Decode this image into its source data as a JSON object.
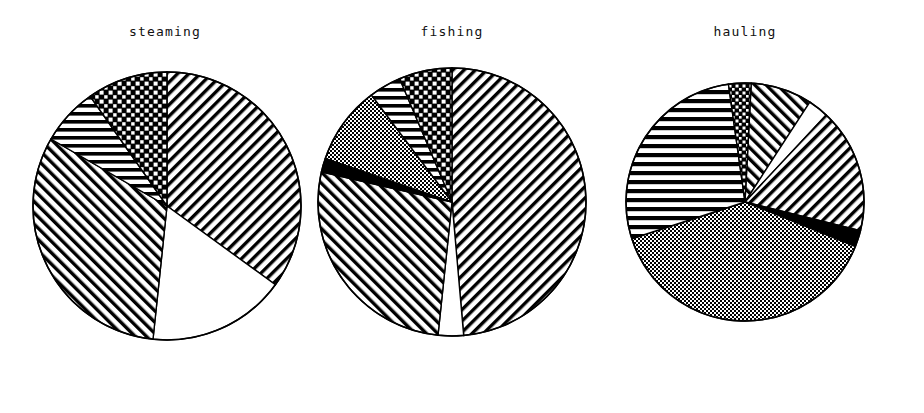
{
  "figure": {
    "background": "#ffffff",
    "outline_color": "#000000",
    "width": 924,
    "height": 413
  },
  "panels": [
    {
      "title": "steaming",
      "center_x": 167,
      "center_y": 206,
      "radius": 134,
      "title_x": 167
    },
    {
      "title": "fishing",
      "center_x": 452,
      "center_y": 202,
      "radius": 134,
      "title_x": 452
    },
    {
      "title": "hauling",
      "center_x": 745,
      "center_y": 202,
      "radius": 119,
      "title_x": 745
    }
  ],
  "chart_data": {
    "type": "pie",
    "title": "",
    "subtitle": "",
    "xlabel": "",
    "ylabel": "",
    "legend_position": "none",
    "grid": false,
    "note": "Three monochrome pie charts with black-and-white fill patterns; slice values are percentages read off the wedge angles, clockwise starting at 12 o'clock.",
    "categories": [
      "checkerboard",
      "horizontal-stripes",
      "grey-stipple",
      "solid-black",
      "backslash-hatch",
      "white",
      "forward-hatch"
    ],
    "charts": [
      {
        "title": "steaming",
        "slices": [
          {
            "label": "forward-hatch",
            "pattern": "forward-hatch",
            "start_deg": 0,
            "end_deg": 126,
            "value": 35.0
          },
          {
            "label": "white",
            "pattern": "white",
            "start_deg": 126,
            "end_deg": 186,
            "value": 16.7
          },
          {
            "label": "backslash-hatch",
            "pattern": "backslash-hatch",
            "start_deg": 186,
            "end_deg": 300,
            "value": 31.7
          },
          {
            "label": "horizontal-stripes",
            "pattern": "horizontal-stripes",
            "start_deg": 300,
            "end_deg": 325,
            "value": 6.9
          },
          {
            "label": "checkerboard",
            "pattern": "checkerboard",
            "start_deg": 325,
            "end_deg": 360,
            "value": 9.7
          }
        ]
      },
      {
        "title": "fishing",
        "slices": [
          {
            "label": "forward-hatch",
            "pattern": "forward-hatch",
            "start_deg": 0,
            "end_deg": 175,
            "value": 48.6
          },
          {
            "label": "white",
            "pattern": "white",
            "start_deg": 175,
            "end_deg": 186,
            "value": 3.1
          },
          {
            "label": "backslash-hatch",
            "pattern": "backslash-hatch",
            "start_deg": 186,
            "end_deg": 283,
            "value": 26.9
          },
          {
            "label": "solid-black",
            "pattern": "solid-black",
            "start_deg": 283,
            "end_deg": 289,
            "value": 1.7
          },
          {
            "label": "grey-stipple",
            "pattern": "grey-stipple",
            "start_deg": 289,
            "end_deg": 323,
            "value": 9.4
          },
          {
            "label": "horizontal-stripes",
            "pattern": "horizontal-stripes",
            "start_deg": 323,
            "end_deg": 337,
            "value": 3.9
          },
          {
            "label": "checkerboard",
            "pattern": "checkerboard",
            "start_deg": 337,
            "end_deg": 360,
            "value": 6.4
          }
        ]
      },
      {
        "title": "hauling",
        "slices": [
          {
            "label": "backslash-hatch",
            "pattern": "backslash-hatch",
            "start_deg": 3,
            "end_deg": 33,
            "value": 8.3
          },
          {
            "label": "white",
            "pattern": "white",
            "start_deg": 33,
            "end_deg": 43,
            "value": 2.8
          },
          {
            "label": "forward-hatch",
            "pattern": "forward-hatch",
            "start_deg": 43,
            "end_deg": 104,
            "value": 16.9
          },
          {
            "label": "solid-black",
            "pattern": "solid-black",
            "start_deg": 104,
            "end_deg": 112,
            "value": 2.2
          },
          {
            "label": "grey-stipple",
            "pattern": "grey-stipple",
            "start_deg": 112,
            "end_deg": 252,
            "value": 38.9
          },
          {
            "label": "horizontal-stripes",
            "pattern": "horizontal-stripes",
            "start_deg": 252,
            "end_deg": 352,
            "value": 27.8
          },
          {
            "label": "checkerboard",
            "pattern": "checkerboard",
            "start_deg": 352,
            "end_deg": 363,
            "value": 3.1
          }
        ]
      }
    ]
  }
}
